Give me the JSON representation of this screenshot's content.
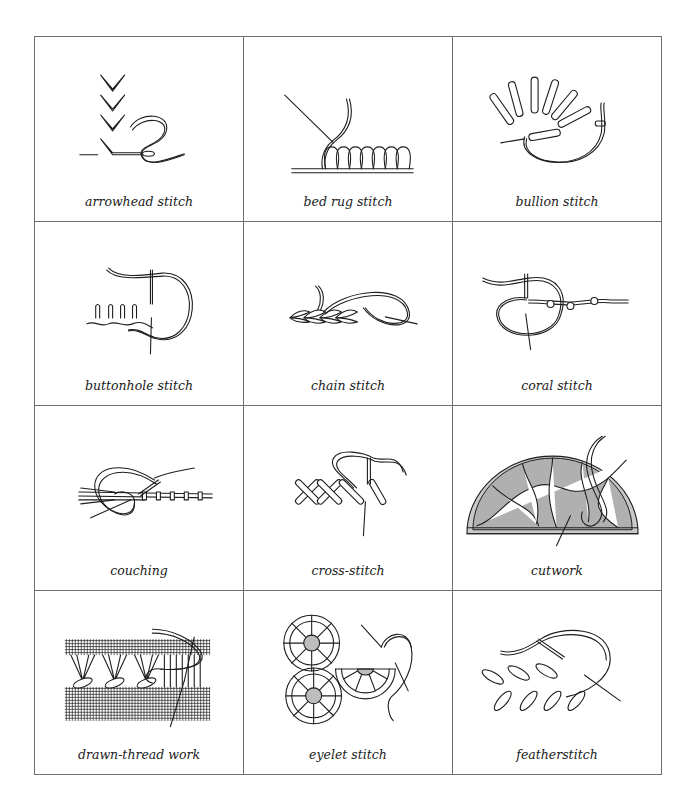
{
  "stitches": [
    {
      "name": "arrowhead stitch",
      "icon": "arrowhead-stitch-illustration"
    },
    {
      "name": "bed rug stitch",
      "icon": "bed-rug-stitch-illustration"
    },
    {
      "name": "bullion stitch",
      "icon": "bullion-stitch-illustration"
    },
    {
      "name": "buttonhole stitch",
      "icon": "buttonhole-stitch-illustration"
    },
    {
      "name": "chain stitch",
      "icon": "chain-stitch-illustration"
    },
    {
      "name": "coral stitch",
      "icon": "coral-stitch-illustration"
    },
    {
      "name": "couching",
      "icon": "couching-illustration"
    },
    {
      "name": "cross-stitch",
      "icon": "cross-stitch-illustration"
    },
    {
      "name": "cutwork",
      "icon": "cutwork-illustration"
    },
    {
      "name": "drawn-thread work",
      "icon": "drawn-thread-work-illustration"
    },
    {
      "name": "eyelet stitch",
      "icon": "eyelet-stitch-illustration"
    },
    {
      "name": "featherstitch",
      "icon": "featherstitch-illustration"
    }
  ]
}
